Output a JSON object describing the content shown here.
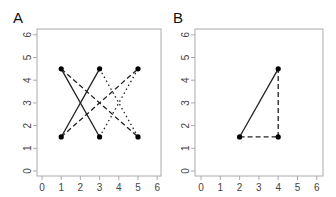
{
  "chart_data": [
    {
      "type": "scatter",
      "panel_label": "A",
      "xlim": [
        0,
        6
      ],
      "ylim": [
        0,
        6
      ],
      "x_ticks": [
        "0",
        "1",
        "2",
        "3",
        "4",
        "5",
        "6"
      ],
      "y_ticks": [
        "0",
        "1",
        "2",
        "3",
        "4",
        "5",
        "6"
      ],
      "points": [
        [
          1,
          4.5
        ],
        [
          1,
          1.5
        ],
        [
          3,
          4.5
        ],
        [
          3,
          1.5
        ],
        [
          5,
          4.5
        ],
        [
          5,
          1.5
        ]
      ],
      "segments": [
        {
          "from": [
            1,
            4.5
          ],
          "to": [
            3,
            1.5
          ],
          "style": "solid"
        },
        {
          "from": [
            1,
            1.5
          ],
          "to": [
            3,
            4.5
          ],
          "style": "solid"
        },
        {
          "from": [
            1,
            4.5
          ],
          "to": [
            5,
            1.5
          ],
          "style": "dashed"
        },
        {
          "from": [
            1,
            1.5
          ],
          "to": [
            5,
            4.5
          ],
          "style": "dashed"
        },
        {
          "from": [
            3,
            4.5
          ],
          "to": [
            5,
            1.5
          ],
          "style": "dotted"
        },
        {
          "from": [
            3,
            1.5
          ],
          "to": [
            5,
            4.5
          ],
          "style": "dotted"
        }
      ],
      "grid": false
    },
    {
      "type": "scatter",
      "panel_label": "B",
      "xlim": [
        0,
        6
      ],
      "ylim": [
        0,
        6
      ],
      "x_ticks": [
        "0",
        "1",
        "2",
        "3",
        "4",
        "5",
        "6"
      ],
      "y_ticks": [
        "0",
        "1",
        "2",
        "3",
        "4",
        "5",
        "6"
      ],
      "points": [
        [
          2,
          1.5
        ],
        [
          4,
          4.5
        ],
        [
          4,
          1.5
        ]
      ],
      "segments": [
        {
          "from": [
            2,
            1.5
          ],
          "to": [
            4,
            4.5
          ],
          "style": "solid"
        },
        {
          "from": [
            2,
            1.5
          ],
          "to": [
            4,
            1.5
          ],
          "style": "dashed"
        },
        {
          "from": [
            4,
            1.5
          ],
          "to": [
            4,
            4.5
          ],
          "style": "dashed"
        }
      ],
      "grid": false
    }
  ],
  "panels": {
    "a": {
      "label": "A"
    },
    "b": {
      "label": "B"
    }
  }
}
